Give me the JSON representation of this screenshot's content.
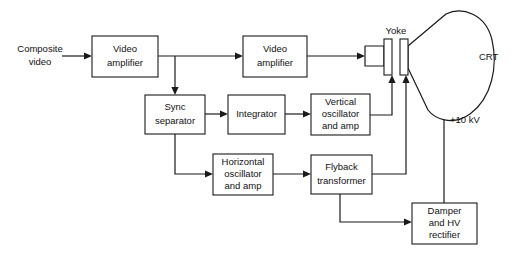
{
  "diagram": {
    "type": "block-diagram",
    "colors": {
      "background": "#ffffff",
      "stroke": "#1a1a1a",
      "text": "#111111"
    },
    "blocks": [
      {
        "id": "video-amplifier-1",
        "label_line1": "Video",
        "label_line2": "amplifier",
        "label_line3": "",
        "x": 92,
        "y": 36,
        "w": 66,
        "h": 41
      },
      {
        "id": "video-amplifier-2",
        "label_line1": "Video",
        "label_line2": "amplifier",
        "label_line3": "",
        "x": 243,
        "y": 36,
        "w": 64,
        "h": 41
      },
      {
        "id": "sync-separator",
        "label_line1": "Sync",
        "label_line2": "separator",
        "label_line3": "",
        "x": 145,
        "y": 95,
        "w": 60,
        "h": 39
      },
      {
        "id": "integrator",
        "label_line1": "Integrator",
        "label_line2": "",
        "label_line3": "",
        "x": 228,
        "y": 95,
        "w": 57,
        "h": 39
      },
      {
        "id": "vertical-oscillator-and-amp",
        "label_line1": "Vertical",
        "label_line2": "oscillator",
        "label_line3": "and amp",
        "x": 311,
        "y": 94,
        "w": 59,
        "h": 41
      },
      {
        "id": "horizontal-oscillator-and-amp",
        "label_line1": "Horizontal",
        "label_line2": "oscillator",
        "label_line3": "and amp",
        "x": 213,
        "y": 154,
        "w": 60,
        "h": 41
      },
      {
        "id": "flyback-transformer",
        "label_line1": "Flyback",
        "label_line2": "transformer",
        "label_line3": "",
        "x": 311,
        "y": 155,
        "w": 61,
        "h": 39
      },
      {
        "id": "damper-and-hv-rectifier",
        "label_line1": "Damper",
        "label_line2": "and HV",
        "label_line3": "rectifier",
        "x": 412,
        "y": 203,
        "w": 65,
        "h": 41
      }
    ],
    "yoke": {
      "label": "Yoke",
      "coil_left": {
        "x": 384,
        "y": 39,
        "w": 8,
        "h": 36
      },
      "coil_right": {
        "x": 400,
        "y": 39,
        "w": 8,
        "h": 36
      }
    },
    "labels": [
      {
        "id": "composite-video-input",
        "text_line1": "Composite",
        "text_line2": "video",
        "x": 40,
        "y": 50
      },
      {
        "id": "yoke-label",
        "text_line1": "Yoke",
        "text_line2": "",
        "x": 396,
        "y": 31
      },
      {
        "id": "crt-label",
        "text_line1": "CRT",
        "text_line2": "",
        "x": 479,
        "y": 57
      },
      {
        "id": "hv-supply-label",
        "text_line1": "+10 kV",
        "text_line2": "",
        "x": 458,
        "y": 120
      }
    ],
    "connections": [
      {
        "id": "input-to-video-amp-1",
        "from": "composite-video-input",
        "to": "video-amplifier-1"
      },
      {
        "id": "video-amp-1-to-video-amp-2",
        "from": "video-amplifier-1",
        "to": "video-amplifier-2"
      },
      {
        "id": "video-amp-1-tap-to-sync-separator",
        "from": "video-amplifier-1",
        "to": "sync-separator"
      },
      {
        "id": "video-amp-2-to-crt-neck",
        "from": "video-amplifier-2",
        "to": "crt"
      },
      {
        "id": "sync-separator-to-integrator",
        "from": "sync-separator",
        "to": "integrator"
      },
      {
        "id": "sync-separator-to-horizontal-oscillator",
        "from": "sync-separator",
        "to": "horizontal-oscillator-and-amp"
      },
      {
        "id": "integrator-to-vertical-oscillator",
        "from": "integrator",
        "to": "vertical-oscillator-and-amp"
      },
      {
        "id": "vertical-oscillator-to-yoke",
        "from": "vertical-oscillator-and-amp",
        "to": "yoke-coil-left"
      },
      {
        "id": "horizontal-oscillator-to-flyback",
        "from": "horizontal-oscillator-and-amp",
        "to": "flyback-transformer"
      },
      {
        "id": "flyback-to-yoke",
        "from": "flyback-transformer",
        "to": "yoke-coil-right"
      },
      {
        "id": "flyback-to-damper",
        "from": "flyback-transformer",
        "to": "damper-and-hv-rectifier"
      },
      {
        "id": "damper-to-crt-anode",
        "from": "damper-and-hv-rectifier",
        "to": "crt-anode"
      }
    ]
  }
}
